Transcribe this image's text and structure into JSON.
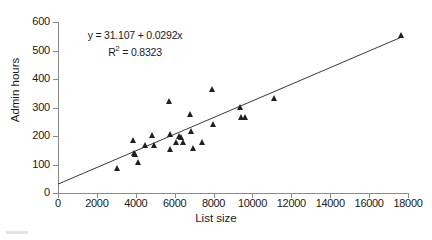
{
  "chart_data": {
    "type": "scatter",
    "title": "",
    "xlabel": "List size",
    "ylabel": "Admin hours",
    "xlim": [
      0,
      18000
    ],
    "ylim": [
      0,
      600
    ],
    "xticks": [
      0,
      2000,
      4000,
      6000,
      8000,
      10000,
      12000,
      14000,
      16000,
      18000
    ],
    "yticks": [
      0,
      100,
      200,
      300,
      400,
      500,
      600
    ],
    "xtick_labels": [
      "0",
      "2000",
      "4000",
      "6000",
      "8000",
      "10000",
      "12000",
      "14000",
      "16000",
      "18000"
    ],
    "ytick_labels": [
      "0",
      "100",
      "200",
      "300",
      "400",
      "500",
      "600"
    ],
    "grid": false,
    "legend": false,
    "marker": "triangle",
    "marker_color": "#231f20",
    "line_color": "#3a3a3a",
    "axis_color": "#8a8a8a",
    "annotation": {
      "equation": "y = 31.107 + 0.0292x",
      "r_squared_label": "R",
      "r_squared_exponent": "2",
      "r_squared_value": " = 0.8323",
      "slope": 0.0292,
      "intercept": 31.107,
      "r_squared": 0.8323,
      "position": "upper-left"
    },
    "trendline": {
      "type": "linear",
      "x_start": 0,
      "y_start": 31.107,
      "x_end": 17700,
      "y_end": 548.0
    },
    "points": [
      {
        "x": 3050,
        "y": 88
      },
      {
        "x": 3900,
        "y": 185
      },
      {
        "x": 3950,
        "y": 140
      },
      {
        "x": 4000,
        "y": 137
      },
      {
        "x": 4150,
        "y": 107
      },
      {
        "x": 4500,
        "y": 168
      },
      {
        "x": 4850,
        "y": 202
      },
      {
        "x": 4950,
        "y": 168
      },
      {
        "x": 5750,
        "y": 322
      },
      {
        "x": 5780,
        "y": 155
      },
      {
        "x": 5800,
        "y": 205
      },
      {
        "x": 6100,
        "y": 178
      },
      {
        "x": 6250,
        "y": 200
      },
      {
        "x": 6350,
        "y": 197
      },
      {
        "x": 6450,
        "y": 178
      },
      {
        "x": 6800,
        "y": 278
      },
      {
        "x": 6850,
        "y": 218
      },
      {
        "x": 6950,
        "y": 158
      },
      {
        "x": 7450,
        "y": 179
      },
      {
        "x": 7950,
        "y": 365
      },
      {
        "x": 8000,
        "y": 241
      },
      {
        "x": 9400,
        "y": 300
      },
      {
        "x": 9450,
        "y": 268
      },
      {
        "x": 9650,
        "y": 265
      },
      {
        "x": 11150,
        "y": 332
      },
      {
        "x": 17650,
        "y": 553
      }
    ]
  }
}
